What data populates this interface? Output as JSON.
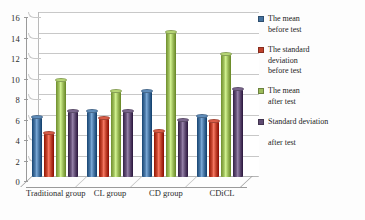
{
  "chart_data": {
    "type": "bar",
    "title": "",
    "xlabel": "",
    "ylabel": "",
    "ylim": [
      0,
      16
    ],
    "ytick_step": 2,
    "grid": true,
    "legend_position": "right",
    "style": "3d-cylinder-clustered",
    "categories": [
      "Traditional group",
      "CL group",
      "CD group",
      "CDiCL"
    ],
    "yticks": [
      "0",
      "2",
      "4",
      "6",
      "8",
      "10",
      "12",
      "14",
      "16"
    ],
    "series": [
      {
        "name": "The mean before test",
        "legend_label": "The mean\nbefore test",
        "color": "#4472A0",
        "values": [
          5.9,
          6.4,
          8.4,
          6.0
        ]
      },
      {
        "name": "The standard deviation before test",
        "legend_label": "The standard\n deviation\nbefore test",
        "color": "#C0412B",
        "values": [
          4.3,
          5.8,
          4.5,
          5.5
        ]
      },
      {
        "name": "The mean after test",
        "legend_label": "The mean\nafter test",
        "color": "#9BBB59",
        "values": [
          9.5,
          8.4,
          14.1,
          12.0
        ]
      },
      {
        "name": "Standard deviation after test",
        "legend_label": "Standard deviation\n\nafter  test",
        "color": "#5F4B72",
        "values": [
          6.4,
          6.4,
          5.6,
          8.6
        ]
      }
    ]
  }
}
